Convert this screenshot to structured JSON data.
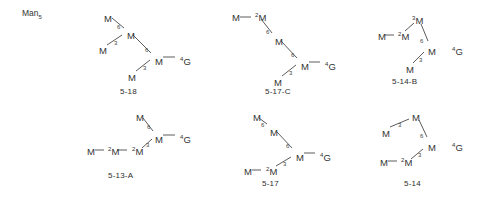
{
  "figure": {
    "corner_label": {
      "text": "Man",
      "subscript": "5"
    },
    "residue_symbol": "M",
    "terminal_symbol": "G",
    "terminal_superscript": "4"
  },
  "structures": [
    {
      "id": "5-18",
      "caption": "5-18",
      "nodes": [
        {
          "name": "upper-arm-terminal",
          "label": "M",
          "prefix": "",
          "x": 104,
          "y": 14
        },
        {
          "name": "lower-arm-terminal",
          "label": "M",
          "prefix": "",
          "x": 99,
          "y": 46
        },
        {
          "name": "branch-core",
          "label": "M",
          "prefix": "",
          "x": 127,
          "y": 31
        },
        {
          "name": "core-residue",
          "label": "M",
          "prefix": "",
          "x": 155,
          "y": 57
        },
        {
          "name": "core-lower-terminal",
          "label": "M",
          "prefix": "",
          "x": 128,
          "y": 73
        },
        {
          "name": "reducing-end",
          "label": "G",
          "prefix": "4",
          "x": 180,
          "y": 57
        }
      ],
      "linkages": [
        {
          "value": "6",
          "x": 117,
          "y": 24
        },
        {
          "value": "3",
          "x": 114,
          "y": 40
        },
        {
          "value": "6",
          "x": 145,
          "y": 47
        },
        {
          "value": "3",
          "x": 143,
          "y": 65
        }
      ],
      "bonds": [
        [
          112,
          18,
          124,
          28
        ],
        [
          107,
          45,
          122,
          35
        ],
        [
          133,
          35,
          151,
          53
        ],
        [
          136,
          71,
          150,
          60
        ],
        [
          163,
          57,
          175,
          57
        ]
      ],
      "caption_pos": {
        "x": 120,
        "y": 88
      }
    },
    {
      "id": "5-17-C",
      "caption": "5-17-C",
      "nodes": [
        {
          "name": "arm-terminal",
          "label": "M",
          "prefix": "",
          "x": 232,
          "y": 13
        },
        {
          "name": "arm-linked",
          "label": "M",
          "prefix": "2",
          "x": 255,
          "y": 13
        },
        {
          "name": "branch-core",
          "label": "M",
          "prefix": "",
          "x": 275,
          "y": 37
        },
        {
          "name": "core-residue",
          "label": "M",
          "prefix": "",
          "x": 301,
          "y": 62
        },
        {
          "name": "core-lower-terminal",
          "label": "M",
          "prefix": "",
          "x": 274,
          "y": 78
        },
        {
          "name": "reducing-end",
          "label": "G",
          "prefix": "4",
          "x": 325,
          "y": 62
        }
      ],
      "linkages": [
        {
          "value": "6",
          "x": 266,
          "y": 29
        },
        {
          "value": "6",
          "x": 291,
          "y": 52
        },
        {
          "value": "3",
          "x": 289,
          "y": 70
        }
      ],
      "bonds": [
        [
          240,
          17,
          251,
          17
        ],
        [
          261,
          19,
          272,
          33
        ],
        [
          281,
          41,
          297,
          58
        ],
        [
          282,
          76,
          296,
          65
        ],
        [
          309,
          62,
          320,
          62
        ]
      ],
      "caption_pos": {
        "x": 265,
        "y": 88
      }
    },
    {
      "id": "5-14-B",
      "caption": "5-14-B",
      "nodes": [
        {
          "name": "upper-branch",
          "label": "M",
          "prefix": "3",
          "x": 412,
          "y": 16
        },
        {
          "name": "arm-terminal",
          "label": "M",
          "prefix": "",
          "x": 378,
          "y": 32
        },
        {
          "name": "arm-linked",
          "label": "M",
          "prefix": "2",
          "x": 398,
          "y": 32
        },
        {
          "name": "core-residue",
          "label": "M",
          "prefix": "",
          "x": 428,
          "y": 47
        },
        {
          "name": "core-lower-terminal",
          "label": "M",
          "prefix": "",
          "x": 406,
          "y": 65
        },
        {
          "name": "reducing-end",
          "label": "G",
          "prefix": "4",
          "x": 452,
          "y": 47
        }
      ],
      "linkages": [
        {
          "value": "6",
          "x": 420,
          "y": 38
        },
        {
          "value": "3",
          "x": 419,
          "y": 57
        }
      ],
      "bonds": [
        [
          385,
          35,
          394,
          35
        ],
        [
          405,
          31,
          414,
          23
        ],
        [
          421,
          24,
          428,
          41
        ],
        [
          413,
          63,
          424,
          52
        ]
      ],
      "caption_pos": {
        "x": 392,
        "y": 78
      }
    },
    {
      "id": "5-13-A",
      "caption": "5-13-A",
      "nodes": [
        {
          "name": "upper-arm-terminal",
          "label": "M",
          "prefix": "",
          "x": 136,
          "y": 113
        },
        {
          "name": "core-residue",
          "label": "M",
          "prefix": "",
          "x": 155,
          "y": 135
        },
        {
          "name": "chain-terminal",
          "label": "M",
          "prefix": "",
          "x": 87,
          "y": 147
        },
        {
          "name": "chain-mid",
          "label": "M",
          "prefix": "2",
          "x": 108,
          "y": 147
        },
        {
          "name": "chain-inner",
          "label": "M",
          "prefix": "2",
          "x": 132,
          "y": 147
        },
        {
          "name": "reducing-end",
          "label": "G",
          "prefix": "4",
          "x": 180,
          "y": 135
        }
      ],
      "linkages": [
        {
          "value": "6",
          "x": 147,
          "y": 124
        },
        {
          "value": "3",
          "x": 146,
          "y": 142
        }
      ],
      "bonds": [
        [
          143,
          118,
          153,
          131
        ],
        [
          95,
          150,
          104,
          150
        ],
        [
          117,
          150,
          127,
          150
        ],
        [
          142,
          148,
          152,
          139
        ],
        [
          163,
          135,
          175,
          135
        ]
      ],
      "caption_pos": {
        "x": 108,
        "y": 172
      }
    },
    {
      "id": "5-17",
      "caption": "5-17",
      "nodes": [
        {
          "name": "upper-arm-terminal",
          "label": "M",
          "prefix": "",
          "x": 253,
          "y": 113
        },
        {
          "name": "branch-core",
          "label": "M",
          "prefix": "",
          "x": 270,
          "y": 128
        },
        {
          "name": "core-residue",
          "label": "M",
          "prefix": "",
          "x": 296,
          "y": 153
        },
        {
          "name": "chain-terminal",
          "label": "M",
          "prefix": "",
          "x": 244,
          "y": 167
        },
        {
          "name": "chain-linked",
          "label": "M",
          "prefix": "2",
          "x": 266,
          "y": 167
        },
        {
          "name": "reducing-end",
          "label": "G",
          "prefix": "4",
          "x": 320,
          "y": 153
        }
      ],
      "linkages": [
        {
          "value": "6",
          "x": 261,
          "y": 122
        },
        {
          "value": "6",
          "x": 286,
          "y": 143
        },
        {
          "value": "3",
          "x": 283,
          "y": 161
        }
      ],
      "bonds": [
        [
          259,
          118,
          267,
          124
        ],
        [
          277,
          132,
          292,
          148
        ],
        [
          252,
          170,
          261,
          170
        ],
        [
          276,
          166,
          291,
          157
        ],
        [
          304,
          153,
          315,
          153
        ]
      ],
      "caption_pos": {
        "x": 262,
        "y": 180
      }
    },
    {
      "id": "5-14",
      "caption": "5-14",
      "nodes": [
        {
          "name": "upper-branch",
          "label": "M",
          "prefix": "",
          "x": 412,
          "y": 113
        },
        {
          "name": "arm-terminal",
          "label": "M",
          "prefix": "",
          "x": 382,
          "y": 129
        },
        {
          "name": "core-residue",
          "label": "M",
          "prefix": "",
          "x": 428,
          "y": 143
        },
        {
          "name": "chain-terminal",
          "label": "M",
          "prefix": "",
          "x": 380,
          "y": 158
        },
        {
          "name": "chain-linked",
          "label": "M",
          "prefix": "2",
          "x": 401,
          "y": 158
        },
        {
          "name": "reducing-end",
          "label": "G",
          "prefix": "4",
          "x": 452,
          "y": 143
        }
      ],
      "linkages": [
        {
          "value": "3",
          "x": 398,
          "y": 122
        },
        {
          "value": "6",
          "x": 420,
          "y": 133
        },
        {
          "value": "3",
          "x": 418,
          "y": 152
        }
      ],
      "bonds": [
        [
          390,
          127,
          409,
          119
        ],
        [
          419,
          120,
          427,
          137
        ],
        [
          388,
          161,
          397,
          161
        ],
        [
          411,
          159,
          423,
          149
        ]
      ],
      "caption_pos": {
        "x": 404,
        "y": 180
      }
    }
  ]
}
